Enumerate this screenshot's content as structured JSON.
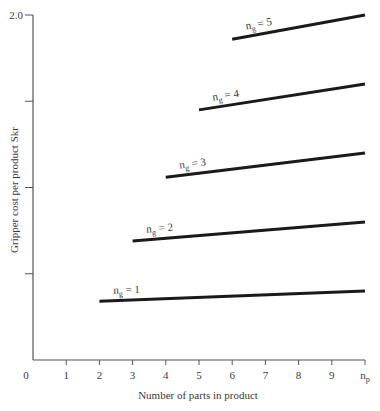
{
  "chart_data": {
    "type": "line",
    "title": "",
    "xlabel": "Number of parts in product",
    "ylabel": "Gripper cost per product  Skr",
    "xlim": [
      0,
      10
    ],
    "ylim": [
      0,
      2.0
    ],
    "x_ticks": [
      {
        "value": 0,
        "label": "0"
      },
      {
        "value": 1,
        "label": "1"
      },
      {
        "value": 2,
        "label": "2"
      },
      {
        "value": 3,
        "label": "3"
      },
      {
        "value": 4,
        "label": "4"
      },
      {
        "value": 5,
        "label": "5"
      },
      {
        "value": 6,
        "label": "6"
      },
      {
        "value": 7,
        "label": "7"
      },
      {
        "value": 8,
        "label": "8"
      },
      {
        "value": 9,
        "label": "9"
      },
      {
        "value": 10,
        "label": "n",
        "label_sub": "p"
      }
    ],
    "y_ticks": [
      {
        "value": 0.5,
        "label": ""
      },
      {
        "value": 1.0,
        "label": ""
      },
      {
        "value": 1.5,
        "label": ""
      },
      {
        "value": 2.0,
        "label": "2.0"
      }
    ],
    "grid": false,
    "legend": "inline labels above each line",
    "series": [
      {
        "name": "ng = 1",
        "label_main": "n",
        "label_sub": "g",
        "label_rest": " = 1",
        "x": [
          2,
          10
        ],
        "y": [
          0.34,
          0.4
        ]
      },
      {
        "name": "ng = 2",
        "label_main": "n",
        "label_sub": "g",
        "label_rest": " = 2",
        "x": [
          3,
          10
        ],
        "y": [
          0.69,
          0.8
        ]
      },
      {
        "name": "ng = 3",
        "label_main": "n",
        "label_sub": "g",
        "label_rest": " = 3",
        "x": [
          4,
          10
        ],
        "y": [
          1.06,
          1.2
        ]
      },
      {
        "name": "ng = 4",
        "label_main": "n",
        "label_sub": "g",
        "label_rest": " = 4",
        "x": [
          5,
          10
        ],
        "y": [
          1.45,
          1.6
        ]
      },
      {
        "name": "ng = 5",
        "label_main": "n",
        "label_sub": "g",
        "label_rest": " = 5",
        "x": [
          6,
          10
        ],
        "y": [
          1.86,
          2.0
        ]
      }
    ],
    "colors": {
      "line": "#1a1a1a",
      "axis": "#555555",
      "text": "#3a3a3a"
    }
  }
}
